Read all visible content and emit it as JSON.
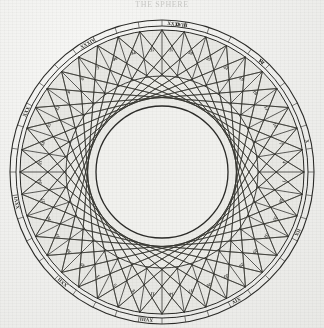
{
  "caption": {
    "text": "THE SPHERE",
    "color": "#c9c9c6"
  },
  "figure": {
    "paper_color": "#efefed",
    "ink_color": "#2b2b28",
    "ring_fill": "#e6e6e2",
    "center_x": 162,
    "center_y": 172,
    "radius_outer_rim": 152,
    "radius_outer_band": 146,
    "radius_cell_outer": 142,
    "radius_cell_inner": 96,
    "radius_envelope": 66,
    "divisions": 40,
    "chord_step": 13
  },
  "cells": {
    "count": 40,
    "start_angle_deg": -90,
    "numbers": [
      "37",
      "38",
      "25",
      "22",
      "19",
      "16",
      "13",
      "10",
      "7",
      "4",
      "1",
      "38",
      "35",
      "32",
      "29",
      "26",
      "23",
      "20",
      "17",
      "14",
      "11",
      "8",
      "5",
      "2",
      "39",
      "36",
      "33",
      "30",
      "27",
      "24",
      "21",
      "18",
      "15",
      "12",
      "9",
      "6",
      "3",
      "40",
      "34",
      "37"
    ]
  },
  "ring_markers": {
    "labels": [
      "II",
      "VI",
      "X",
      "IIX",
      "XIV",
      "XVIII",
      "XXII",
      "XXVI",
      "XXX",
      "XXXIV",
      "XXXVIII",
      "IV"
    ],
    "angles_deg": [
      -84,
      -48,
      -12,
      24,
      60,
      96,
      132,
      168,
      204,
      240,
      276,
      312
    ]
  },
  "legend": {
    "inner_circle_label": "",
    "note": ""
  }
}
